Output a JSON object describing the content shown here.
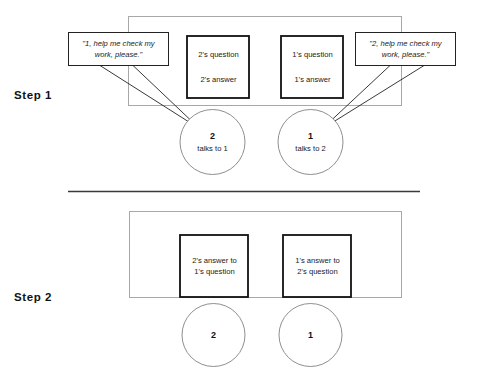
{
  "figure": {
    "top_cut_fragment": "correct final answer",
    "steps": [
      {
        "id": "step-1",
        "label": "Step 1",
        "bubbles": [
          {
            "id": "bubble-left",
            "line1": "\"1, help me check my",
            "line2": "work, please.\""
          },
          {
            "id": "bubble-right",
            "line1": "\"2, help me check my",
            "line2": "work, please.\""
          }
        ],
        "boxes": [
          {
            "id": "box-2-qa",
            "line1": "2's question",
            "line2": "2's answer"
          },
          {
            "id": "box-1-qa",
            "line1": "1's question",
            "line2": "1's answer"
          }
        ],
        "circles": [
          {
            "id": "circle-2",
            "number": "2",
            "caption": "talks to 1"
          },
          {
            "id": "circle-1",
            "number": "1",
            "caption": "talks to 2"
          }
        ]
      },
      {
        "id": "step-2",
        "label": "Step 2",
        "boxes": [
          {
            "id": "box-2-answer",
            "line1": "2's answer to",
            "line2": "1's question"
          },
          {
            "id": "box-1-answer",
            "line1": "1's answer to",
            "line2": "2's question"
          }
        ],
        "circles": [
          {
            "id": "circle-2",
            "number": "2",
            "caption": ""
          },
          {
            "id": "circle-1",
            "number": "1",
            "caption": ""
          }
        ]
      }
    ],
    "colors": {
      "stroke_dark": "#111111",
      "stroke_light": "#9a9a9a",
      "divider": "#3a3a3a",
      "background": "#ffffff"
    }
  }
}
